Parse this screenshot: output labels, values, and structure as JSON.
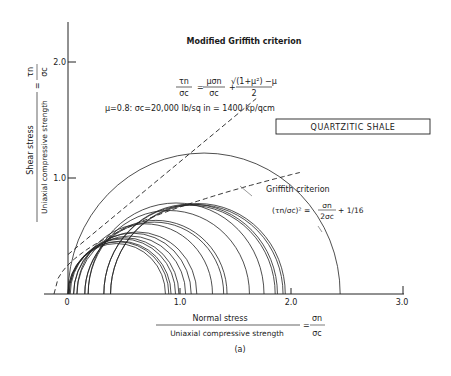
{
  "chart_data": {
    "type": "scatter",
    "subtype": "mohr-circle-envelope",
    "title": "Modified Griffith criterion",
    "subtitle_equation": "τn/σc = μσn/σc + (√(1+μ²) − μ)/2",
    "parameters_text": "μ=0.8: σc=20,000 lb/sq in = 1400 kp/qcm",
    "rock_label": "QUARTZITIC SHALE",
    "griffith_label": "Griffith criterion",
    "griffith_equation": "(τn/σc)² = σn/(2σc) + 1/16",
    "figure_label": "(a)",
    "xlabel": "Normal stress / Uniaxial compressive strength = σn/σc",
    "xlabel_num": "Normal stress",
    "xlabel_den": "Uniaxial compressive strength",
    "ylabel": "Shear stress / Uniaxial compressive strength = τn/σc",
    "ylabel_num": "Shear stress",
    "ylabel_den": "Uniaxial compressive strength",
    "x_ticks": [
      "0",
      "1.0",
      "2.0",
      "3.0"
    ],
    "y_ticks": [
      "1.0",
      "2.0"
    ],
    "xlim": [
      -0.15,
      3.0
    ],
    "ylim": [
      0,
      2.3
    ],
    "grid": false,
    "mu": 0.8,
    "modified_griffith_line": {
      "slope": 0.8,
      "intercept": 0.3403,
      "x_range": [
        0.0,
        1.68
      ]
    },
    "griffith_parabola": {
      "x_range": [
        -0.125,
        2.07
      ]
    },
    "mohr_circles": [
      {
        "s3": 0.0,
        "s1": 0.87
      },
      {
        "s3": 0.0,
        "s1": 0.9
      },
      {
        "s3": 0.01,
        "s1": 0.92
      },
      {
        "s3": 0.01,
        "s1": 0.96
      },
      {
        "s3": 0.02,
        "s1": 0.99
      },
      {
        "s3": 0.05,
        "s1": 1.05
      },
      {
        "s3": 0.05,
        "s1": 1.1
      },
      {
        "s3": 0.08,
        "s1": 1.15
      },
      {
        "s3": 0.08,
        "s1": 1.29
      },
      {
        "s3": 0.15,
        "s1": 1.39
      },
      {
        "s3": 0.15,
        "s1": 1.42
      },
      {
        "s3": 0.18,
        "s1": 1.62
      },
      {
        "s3": 0.18,
        "s1": 1.75
      },
      {
        "s3": 0.32,
        "s1": 1.85
      },
      {
        "s3": 0.32,
        "s1": 1.87
      },
      {
        "s3": 0.38,
        "s1": 1.92
      },
      {
        "s3": 0.38,
        "s1": 1.94
      },
      {
        "s3": 0.0,
        "s1": 2.43
      }
    ]
  },
  "labels": {
    "title": "Modified Griffith criterion",
    "eq_lhs_num": "τn",
    "eq_lhs_den": "σc",
    "eq_mid_num": "μσn",
    "eq_mid_den": "σc",
    "eq_rhs_num": "√(1+μ²) −μ",
    "eq_rhs_den": "2",
    "params": "μ=0.8: σc=20,000 lb/sq in = 1400 kp/qcm",
    "rock": "QUARTZITIC SHALE",
    "griffith": "Griffith criterion",
    "griffith_eq_a": "(τn/σc)² =",
    "griffith_eq_b_num": "σn",
    "griffith_eq_b_den": "2σc",
    "griffith_eq_c": "+ 1/16",
    "x_num": "Normal stress",
    "x_den": "Uniaxial compressive strength",
    "x_sym_num": "σn",
    "x_sym_den": "σc",
    "y_num": "Shear stress",
    "y_den": "Uniaxial compressive strength",
    "y_sym_num": "τn",
    "y_sym_den": "σc",
    "fig": "(a)",
    "xt0": "0",
    "xt1": "1.0",
    "xt2": "2.0",
    "xt3": "3.0",
    "yt1": "1.0",
    "yt2": "2.0"
  }
}
